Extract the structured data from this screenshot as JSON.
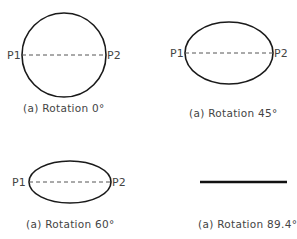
{
  "panels": [
    {
      "caption": "(a)  Rotation  0°",
      "shape": "circle",
      "p1_label": "P1",
      "p2_label": "P2"
    },
    {
      "caption": "(a)  Rotation  45°",
      "shape": "ellipse",
      "p1_label": "P1",
      "p2_label": "P2"
    },
    {
      "caption": "(a)  Rotation  60°",
      "shape": "ellipse",
      "p1_label": "P1",
      "p2_label": "P2"
    },
    {
      "caption": "(a)  Rotation  89.4°",
      "shape": "line"
    }
  ],
  "colors": {
    "stroke": "#1a1a1a",
    "text": "#444444",
    "background": "#ffffff"
  }
}
